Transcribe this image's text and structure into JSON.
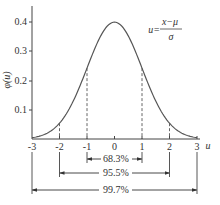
{
  "chart_data": {
    "type": "line",
    "title": "",
    "xlabel": "u",
    "ylabel": "φ(u)",
    "formula": {
      "lhs": "u=",
      "numerator": "x−μ",
      "denominator": "σ"
    },
    "xlim": [
      -3,
      3
    ],
    "ylim": [
      0,
      0.45
    ],
    "x_ticks": [
      "-3",
      "-2",
      "-1",
      "0",
      "1",
      "2",
      "3"
    ],
    "y_ticks": [
      "0.1",
      "0.2",
      "0.3",
      "0.4"
    ],
    "grid": false,
    "series": [
      {
        "name": "standard normal density",
        "x": [
          -3,
          -2.5,
          -2,
          -1.5,
          -1,
          -0.5,
          0,
          0.5,
          1,
          1.5,
          2,
          2.5,
          3
        ],
        "values": [
          0.004,
          0.018,
          0.054,
          0.13,
          0.242,
          0.352,
          0.399,
          0.352,
          0.242,
          0.13,
          0.054,
          0.018,
          0.004
        ]
      }
    ],
    "dashed_verticals": [
      -2,
      -1,
      1,
      2
    ],
    "intervals": [
      {
        "from": -1,
        "to": 1,
        "label": "68.3%"
      },
      {
        "from": -2,
        "to": 2,
        "label": "95.5%"
      },
      {
        "from": -3,
        "to": 3,
        "label": "99.7%"
      }
    ]
  }
}
